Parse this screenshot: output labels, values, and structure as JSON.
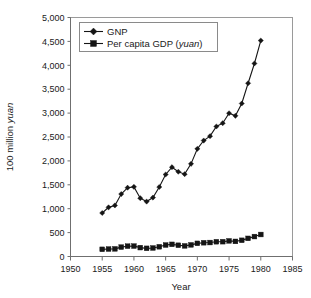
{
  "chart_data": {
    "type": "line",
    "title": "",
    "subtitle": "",
    "xlabel": "Year",
    "ylabel": "100 million yuan",
    "ylabel_italic_part": "yuan",
    "xlim": [
      1950,
      1985
    ],
    "ylim": [
      0,
      5000
    ],
    "xticks": [
      1950,
      1955,
      1960,
      1965,
      1970,
      1975,
      1980,
      1985
    ],
    "xtick_labels": [
      "1950",
      "1955",
      "1960",
      "1965",
      "1970",
      "1975",
      "1980",
      "1985"
    ],
    "yticks": [
      0,
      500,
      1000,
      1500,
      2000,
      2500,
      3000,
      3500,
      4000,
      4500,
      5000
    ],
    "ytick_labels": [
      "0",
      "500",
      "1,000",
      "1,500",
      "2,000",
      "2,500",
      "3,000",
      "3,500",
      "4,000",
      "4,500",
      "5,000"
    ],
    "grid": false,
    "legend_position": "top-left",
    "x": [
      1955,
      1956,
      1957,
      1958,
      1959,
      1960,
      1961,
      1962,
      1963,
      1964,
      1965,
      1966,
      1967,
      1968,
      1969,
      1970,
      1971,
      1972,
      1973,
      1974,
      1975,
      1976,
      1977,
      1978,
      1979,
      1980
    ],
    "series": [
      {
        "name": "GNP",
        "marker": "diamond",
        "color": "#151515",
        "values": [
          910,
          1028,
          1068,
          1307,
          1439,
          1457,
          1220,
          1149,
          1233,
          1454,
          1716,
          1868,
          1773,
          1723,
          1938,
          2252,
          2426,
          2518,
          2720,
          2789,
          2997,
          2944,
          3201,
          3624,
          4038,
          4518
        ]
      },
      {
        "name": "Per capita GDP (yuan)",
        "name_plain": "Per capita GDP (",
        "name_italic": "yuan",
        "name_suffix": ")",
        "marker": "square",
        "color": "#151515",
        "values": [
          150,
          156,
          160,
          196,
          216,
          218,
          186,
          171,
          178,
          204,
          240,
          254,
          235,
          222,
          243,
          275,
          288,
          292,
          309,
          310,
          327,
          316,
          339,
          379,
          417,
          460
        ]
      }
    ]
  },
  "legend": {
    "entries": [
      {
        "label": "GNP",
        "marker": "diamond-marker-icon"
      },
      {
        "label": "Per capita GDP (yuan)",
        "marker": "square-marker-icon"
      }
    ]
  },
  "axes": {
    "x_title": "Year",
    "y_title_prefix": "100 million ",
    "y_title_italic": "yuan"
  }
}
